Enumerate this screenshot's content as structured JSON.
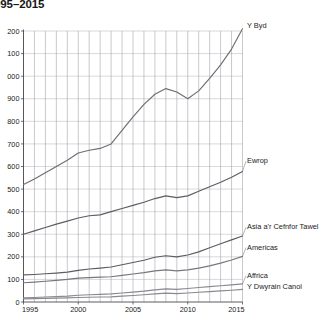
{
  "title": "995–2015",
  "chart_data": {
    "type": "line",
    "title": "995–2015",
    "xlabel": "",
    "ylabel": "",
    "grid": true,
    "legend_position": "right-inline-labels",
    "xlim": [
      1995,
      2015
    ],
    "ylim": [
      0,
      1200
    ],
    "xticks": [
      "1995",
      "2000",
      "2005",
      "2010",
      "2015"
    ],
    "xtick_values": [
      1995,
      2000,
      2005,
      2010,
      2015
    ],
    "yticks": [
      "0",
      "100",
      "200",
      "300",
      "400",
      "500",
      "600",
      "700",
      "800",
      "900",
      "000",
      "100",
      "200"
    ],
    "ytick_values": [
      0,
      100,
      200,
      300,
      400,
      500,
      600,
      700,
      800,
      900,
      1000,
      1100,
      1200
    ],
    "x": [
      1995,
      1996,
      1997,
      1998,
      1999,
      2000,
      2001,
      2002,
      2003,
      2004,
      2005,
      2006,
      2007,
      2008,
      2009,
      2010,
      2011,
      2012,
      2013,
      2014,
      2015
    ],
    "series": [
      {
        "name": "Y Byd",
        "color": "#6e6e73",
        "label_x": 2015,
        "label_y": 1215,
        "values": [
          520,
          545,
          572,
          600,
          628,
          660,
          672,
          680,
          700,
          760,
          820,
          875,
          920,
          945,
          930,
          900,
          935,
          990,
          1050,
          1120,
          1210
        ]
      },
      {
        "name": "Ewrop",
        "color": "#5c5c63",
        "label_x": 2015,
        "label_y": 615,
        "values": [
          300,
          315,
          330,
          345,
          358,
          372,
          382,
          386,
          400,
          414,
          428,
          442,
          458,
          470,
          462,
          470,
          490,
          510,
          530,
          552,
          578
        ]
      },
      {
        "name": "Asia a'r Cefnfor Tawel",
        "color": "#5c5c63",
        "label_x": 2015,
        "label_y": 322,
        "values": [
          120,
          122,
          125,
          128,
          132,
          140,
          146,
          150,
          155,
          165,
          175,
          185,
          198,
          205,
          200,
          208,
          222,
          240,
          258,
          275,
          292
        ]
      },
      {
        "name": "Americas",
        "color": "#77777d",
        "label_x": 2015,
        "label_y": 232,
        "values": [
          85,
          88,
          92,
          96,
          100,
          106,
          108,
          110,
          112,
          118,
          124,
          130,
          138,
          142,
          138,
          142,
          150,
          160,
          172,
          186,
          202
        ]
      },
      {
        "name": "Affrica",
        "color": "#8a8a90",
        "label_x": 2015,
        "label_y": 108,
        "values": [
          18,
          20,
          22,
          24,
          26,
          30,
          32,
          34,
          36,
          40,
          44,
          48,
          54,
          58,
          56,
          60,
          64,
          68,
          72,
          76,
          80
        ]
      },
      {
        "name": "Y Dwyrain Canol",
        "color": "#8a8a90",
        "label_x": 2015,
        "label_y": 58,
        "values": [
          14,
          15,
          16,
          17,
          18,
          20,
          21,
          22,
          23,
          26,
          29,
          32,
          36,
          39,
          37,
          40,
          43,
          46,
          49,
          52,
          56
        ]
      }
    ]
  }
}
